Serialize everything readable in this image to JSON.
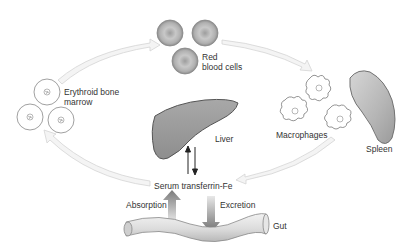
{
  "diagram": {
    "labels": {
      "erythroid_line1": "Erythroid bone",
      "erythroid_line2": "marrow",
      "rbc_line1": "Red",
      "rbc_line2": "blood cells",
      "macrophages": "Macrophages",
      "spleen": "Spleen",
      "liver": "Liver",
      "serum": "Serum transferrin-Fe",
      "absorption": "Absorption",
      "excretion": "Excretion",
      "gut": "Gut"
    },
    "colors": {
      "arrow_fill": "#f4f4f4",
      "arrow_stroke": "#d4d4d4",
      "organ_fill": "#9a9a9a",
      "outline": "#555555",
      "text": "#333333"
    }
  }
}
